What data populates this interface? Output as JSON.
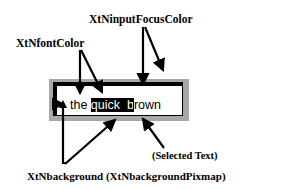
{
  "labels": {
    "input_focus_color": "XtNinputFocusColor",
    "font_color": "XtNfontColor",
    "selected_text": "(Selected Text)",
    "background": "XtNbackground (XtNbackgroundPixmap)"
  },
  "text_field": {
    "before_selection": "the ",
    "selection": "quick  b",
    "after_selection": "rown"
  },
  "colors": {
    "outer_border": "#a8a8a8",
    "inner_border": "#000000",
    "selection_bg": "#000000",
    "selection_fg": "#ffffff"
  }
}
